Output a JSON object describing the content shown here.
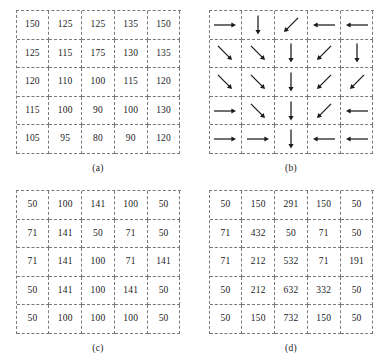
{
  "figure": {
    "colors": {
      "grid_line": "#7a7a7a",
      "text": "#1a1a1a",
      "arrow": "#1a1a1a",
      "background": "#ffffff"
    }
  },
  "panels": [
    {
      "id": "a",
      "caption": "(a)",
      "kind": "numeric",
      "rows": [
        [
          "150",
          "125",
          "125",
          "135",
          "150"
        ],
        [
          "125",
          "115",
          "175",
          "130",
          "135"
        ],
        [
          "120",
          "110",
          "100",
          "115",
          "120"
        ],
        [
          "115",
          "100",
          "90",
          "100",
          "130"
        ],
        [
          "105",
          "95",
          "80",
          "90",
          "120"
        ]
      ]
    },
    {
      "id": "b",
      "caption": "(b)",
      "kind": "arrows",
      "rows": [
        [
          "right",
          "down",
          "down-left",
          "left",
          "left"
        ],
        [
          "down-right",
          "down-right",
          "down",
          "down-left",
          "down"
        ],
        [
          "down-right",
          "down-right",
          "down",
          "down-left",
          "down-left"
        ],
        [
          "right",
          "down-right",
          "down",
          "down-left",
          "left"
        ],
        [
          "right",
          "right",
          "down",
          "left",
          "left"
        ]
      ]
    },
    {
      "id": "c",
      "caption": "(c)",
      "kind": "numeric",
      "rows": [
        [
          "50",
          "100",
          "141",
          "100",
          "50"
        ],
        [
          "71",
          "141",
          "50",
          "71",
          "50"
        ],
        [
          "71",
          "141",
          "100",
          "71",
          "141"
        ],
        [
          "50",
          "141",
          "100",
          "141",
          "50"
        ],
        [
          "50",
          "100",
          "100",
          "100",
          "50"
        ]
      ]
    },
    {
      "id": "d",
      "caption": "(d)",
      "kind": "numeric",
      "rows": [
        [
          "50",
          "150",
          "291",
          "150",
          "50"
        ],
        [
          "71",
          "432",
          "50",
          "71",
          "50"
        ],
        [
          "71",
          "212",
          "532",
          "71",
          "191"
        ],
        [
          "50",
          "212",
          "632",
          "332",
          "50"
        ],
        [
          "50",
          "150",
          "732",
          "150",
          "50"
        ]
      ]
    }
  ],
  "chart_data": {
    "type": "table",
    "title": "",
    "panels": {
      "a": {
        "label": "(a)",
        "description": "5x5 intensity value grid",
        "values": [
          [
            150,
            125,
            125,
            135,
            150
          ],
          [
            125,
            115,
            175,
            130,
            135
          ],
          [
            120,
            110,
            100,
            115,
            120
          ],
          [
            115,
            100,
            90,
            100,
            130
          ],
          [
            105,
            95,
            80,
            90,
            120
          ]
        ]
      },
      "b": {
        "label": "(b)",
        "description": "5x5 gradient direction vector grid",
        "directions": [
          [
            "right",
            "down",
            "down-left",
            "left",
            "left"
          ],
          [
            "down-right",
            "down-right",
            "down",
            "down-left",
            "down"
          ],
          [
            "down-right",
            "down-right",
            "down",
            "down-left",
            "down-left"
          ],
          [
            "right",
            "down-right",
            "down",
            "down-left",
            "left"
          ],
          [
            "right",
            "right",
            "down",
            "left",
            "left"
          ]
        ]
      },
      "c": {
        "label": "(c)",
        "description": "5x5 gradient magnitude grid",
        "values": [
          [
            50,
            100,
            141,
            100,
            50
          ],
          [
            71,
            141,
            50,
            71,
            50
          ],
          [
            71,
            141,
            100,
            71,
            141
          ],
          [
            50,
            141,
            100,
            141,
            50
          ],
          [
            50,
            100,
            100,
            100,
            50
          ]
        ]
      },
      "d": {
        "label": "(d)",
        "description": "5x5 accumulated value grid",
        "values": [
          [
            50,
            150,
            291,
            150,
            50
          ],
          [
            71,
            432,
            50,
            71,
            50
          ],
          [
            71,
            212,
            532,
            71,
            191
          ],
          [
            50,
            212,
            632,
            332,
            50
          ],
          [
            50,
            150,
            732,
            150,
            50
          ]
        ]
      }
    }
  }
}
